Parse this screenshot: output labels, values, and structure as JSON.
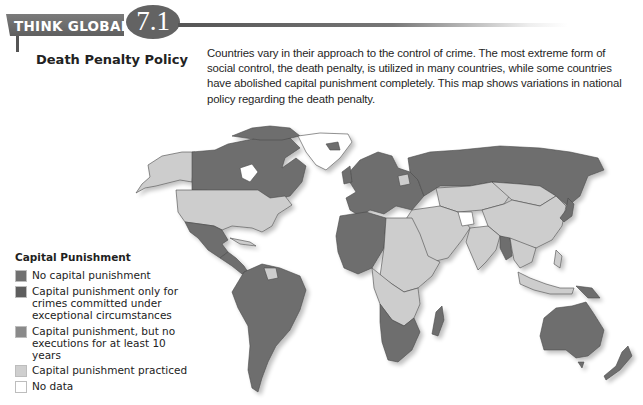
{
  "header": {
    "label": "THINK GLOBALLY",
    "number": "7.1",
    "subtitle": "Death Penalty Policy"
  },
  "description": {
    "lines": [
      "Countries vary in their approach to the control of crime. The most extreme form of",
      "social control, the death penalty, is utilized in many countries, while some countries",
      "have abolished capital punishment completely. This map shows variations in national",
      "policy regarding the death penalty."
    ]
  },
  "legend": {
    "title": "Capital Punishment",
    "items": [
      {
        "label": "No capital punishment",
        "color": "#707070"
      },
      {
        "label": "Capital punishment only for crimes committed under exceptional circumstances",
        "color": "#5e5e5e"
      },
      {
        "label": "Capital punishment, but no executions for at least 10 years",
        "color": "#8a8a8a"
      },
      {
        "label": "Capital punishment practiced",
        "color": "#cfcfcf"
      },
      {
        "label": "No data",
        "color": "#ffffff"
      }
    ]
  },
  "map": {
    "colors": {
      "abolished": "#6e6e6e",
      "practiced": "#cdcdcd",
      "no_data": "#ffffff",
      "border": "#4a4a4a",
      "shadow": "#d4d4d4"
    },
    "regions": [
      {
        "name": "Alaska",
        "status": "practiced"
      },
      {
        "name": "Canada",
        "status": "abolished"
      },
      {
        "name": "Greenland",
        "status": "no_data"
      },
      {
        "name": "United States",
        "status": "practiced"
      },
      {
        "name": "Mexico",
        "status": "abolished"
      },
      {
        "name": "Central America",
        "status": "abolished"
      },
      {
        "name": "Cuba",
        "status": "practiced"
      },
      {
        "name": "South America",
        "status": "abolished"
      },
      {
        "name": "Guyana",
        "status": "practiced"
      },
      {
        "name": "Europe",
        "status": "abolished"
      },
      {
        "name": "Russia",
        "status": "abolished"
      },
      {
        "name": "Belarus",
        "status": "practiced"
      },
      {
        "name": "Central Asia",
        "status": "practiced"
      },
      {
        "name": "China",
        "status": "practiced"
      },
      {
        "name": "Mongolia",
        "status": "practiced"
      },
      {
        "name": "Middle East",
        "status": "practiced"
      },
      {
        "name": "Afghanistan",
        "status": "no_data"
      },
      {
        "name": "India",
        "status": "practiced"
      },
      {
        "name": "Myanmar",
        "status": "abolished"
      },
      {
        "name": "Southeast Asia",
        "status": "practiced"
      },
      {
        "name": "Japan",
        "status": "abolished"
      },
      {
        "name": "North Africa West",
        "status": "abolished"
      },
      {
        "name": "North Africa East",
        "status": "practiced"
      },
      {
        "name": "Central Africa",
        "status": "practiced"
      },
      {
        "name": "Southern Africa",
        "status": "abolished"
      },
      {
        "name": "Madagascar",
        "status": "abolished"
      },
      {
        "name": "Indonesia",
        "status": "practiced"
      },
      {
        "name": "Papua New Guinea",
        "status": "abolished"
      },
      {
        "name": "Australia",
        "status": "abolished"
      },
      {
        "name": "New Zealand",
        "status": "abolished"
      }
    ]
  }
}
